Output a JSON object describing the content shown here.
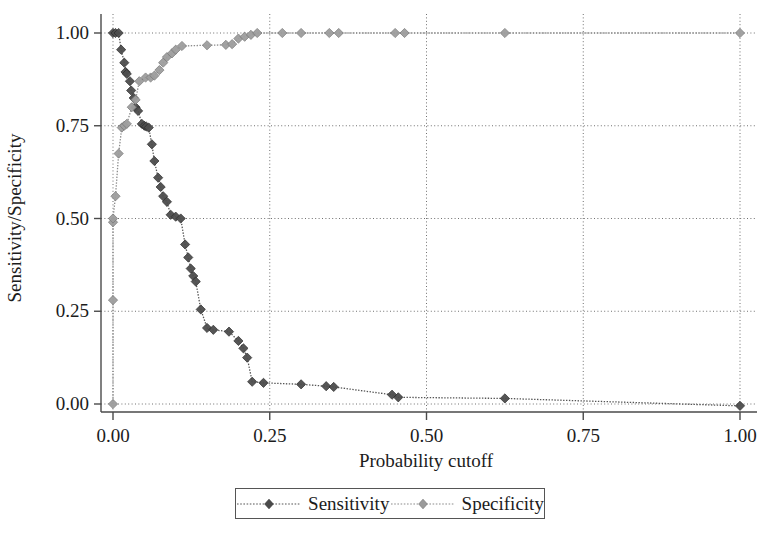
{
  "chart_data": {
    "type": "line",
    "title": "",
    "xlabel": "Probability cutoff",
    "ylabel": "Sensitivity/Specificity",
    "xlim": [
      0.0,
      1.0
    ],
    "ylim": [
      0.0,
      1.0
    ],
    "grid": true,
    "legend_position": "below-center",
    "xticks": [
      "0.00",
      "0.25",
      "0.50",
      "0.75",
      "1.00"
    ],
    "xtick_values": [
      0.0,
      0.25,
      0.5,
      0.75,
      1.0
    ],
    "yticks": [
      "0.00",
      "0.25",
      "0.50",
      "0.75",
      "1.00"
    ],
    "ytick_values": [
      0.0,
      0.25,
      0.5,
      0.75,
      1.0
    ],
    "marker": "diamond",
    "series": [
      {
        "name": "Sensitivity",
        "color": "#444444",
        "points": [
          [
            0.0,
            1.0
          ],
          [
            0.004,
            1.0
          ],
          [
            0.009,
            1.0
          ],
          [
            0.013,
            0.955
          ],
          [
            0.018,
            0.92
          ],
          [
            0.02,
            0.895
          ],
          [
            0.022,
            0.89
          ],
          [
            0.027,
            0.87
          ],
          [
            0.029,
            0.845
          ],
          [
            0.033,
            0.825
          ],
          [
            0.036,
            0.8
          ],
          [
            0.04,
            0.79
          ],
          [
            0.046,
            0.755
          ],
          [
            0.05,
            0.75
          ],
          [
            0.053,
            0.748
          ],
          [
            0.057,
            0.745
          ],
          [
            0.062,
            0.7
          ],
          [
            0.066,
            0.655
          ],
          [
            0.072,
            0.61
          ],
          [
            0.076,
            0.585
          ],
          [
            0.08,
            0.56
          ],
          [
            0.086,
            0.545
          ],
          [
            0.092,
            0.51
          ],
          [
            0.1,
            0.505
          ],
          [
            0.108,
            0.5
          ],
          [
            0.115,
            0.43
          ],
          [
            0.12,
            0.395
          ],
          [
            0.124,
            0.365
          ],
          [
            0.128,
            0.345
          ],
          [
            0.132,
            0.33
          ],
          [
            0.14,
            0.255
          ],
          [
            0.15,
            0.205
          ],
          [
            0.16,
            0.2
          ],
          [
            0.185,
            0.195
          ],
          [
            0.2,
            0.17
          ],
          [
            0.208,
            0.15
          ],
          [
            0.214,
            0.125
          ],
          [
            0.222,
            0.06
          ],
          [
            0.24,
            0.057
          ],
          [
            0.3,
            0.053
          ],
          [
            0.34,
            0.048
          ],
          [
            0.352,
            0.046
          ],
          [
            0.445,
            0.025
          ],
          [
            0.455,
            0.018
          ],
          [
            0.625,
            0.015
          ],
          [
            1.0,
            -0.005
          ]
        ]
      },
      {
        "name": "Specificity",
        "color": "#999999",
        "points": [
          [
            0.0,
            0.0
          ],
          [
            0.0,
            0.28
          ],
          [
            0.0,
            0.49
          ],
          [
            0.0,
            0.5
          ],
          [
            0.004,
            0.56
          ],
          [
            0.009,
            0.675
          ],
          [
            0.014,
            0.745
          ],
          [
            0.018,
            0.75
          ],
          [
            0.022,
            0.755
          ],
          [
            0.03,
            0.8
          ],
          [
            0.036,
            0.82
          ],
          [
            0.042,
            0.87
          ],
          [
            0.052,
            0.88
          ],
          [
            0.06,
            0.88
          ],
          [
            0.066,
            0.885
          ],
          [
            0.074,
            0.9
          ],
          [
            0.08,
            0.92
          ],
          [
            0.086,
            0.935
          ],
          [
            0.094,
            0.945
          ],
          [
            0.1,
            0.955
          ],
          [
            0.11,
            0.965
          ],
          [
            0.15,
            0.967
          ],
          [
            0.18,
            0.968
          ],
          [
            0.19,
            0.97
          ],
          [
            0.2,
            0.985
          ],
          [
            0.21,
            0.99
          ],
          [
            0.22,
            0.995
          ],
          [
            0.23,
            1.0
          ],
          [
            0.27,
            1.0
          ],
          [
            0.3,
            1.0
          ],
          [
            0.345,
            1.0
          ],
          [
            0.36,
            1.0
          ],
          [
            0.45,
            1.0
          ],
          [
            0.465,
            1.0
          ],
          [
            0.625,
            1.0
          ],
          [
            1.0,
            1.0
          ]
        ]
      }
    ]
  },
  "axes": {
    "x_title": "Probability cutoff",
    "y_title": "Sensitivity/Specificity"
  },
  "legend": {
    "entries": [
      {
        "label": "Sensitivity"
      },
      {
        "label": "Specificity"
      }
    ]
  }
}
